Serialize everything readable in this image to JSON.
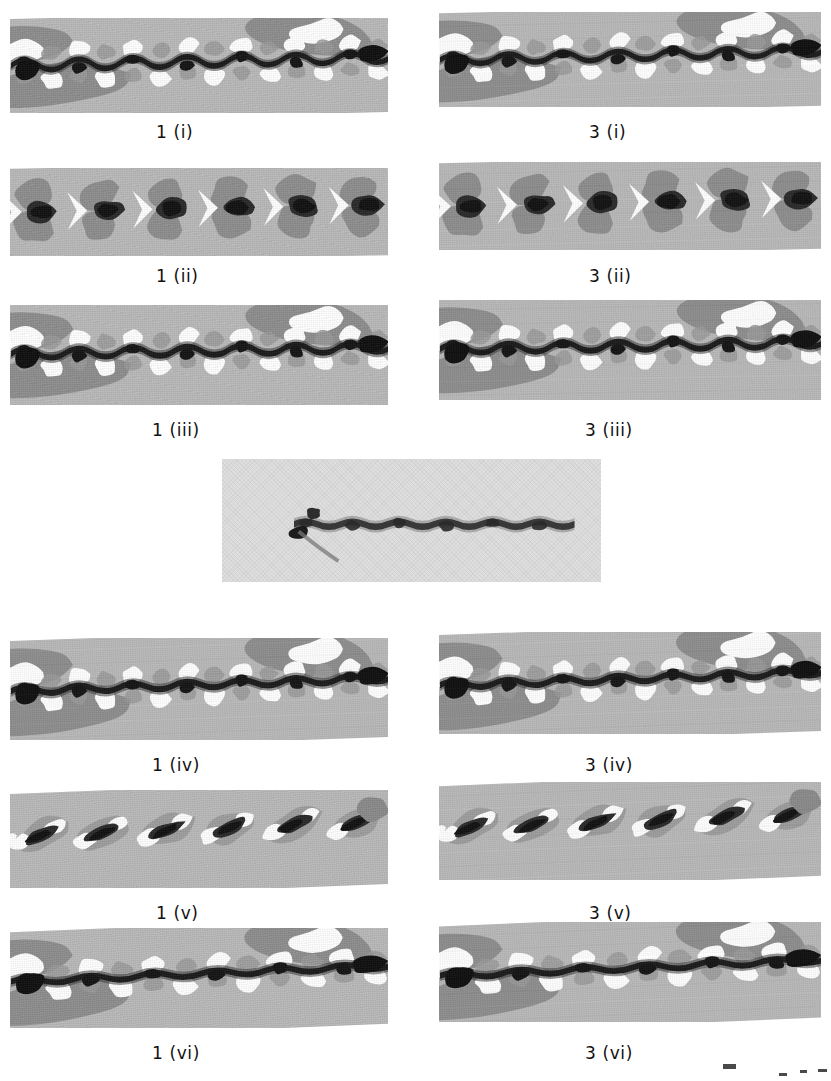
{
  "figure": {
    "width": 831,
    "height": 1081,
    "background_color": "#ffffff",
    "panel_count": 13,
    "columns": [
      "1",
      "3"
    ],
    "caption_color": "#111111",
    "plate_colors": {
      "mid_gray": "#b9b9b9",
      "dark_gray": "#8e8e8e",
      "black": "#1b1b1b",
      "white": "#ffffff",
      "photo_gray": "#dedede"
    }
  },
  "panels": [
    {
      "id": "p-1-i",
      "label": "1 (i)",
      "column": "1",
      "row": "i",
      "x": 10,
      "y": 18,
      "w": 378,
      "h": 95,
      "caption_x": 156,
      "caption_y": 122,
      "style": "wavy-filament",
      "lobes": 7,
      "amplitude": 9,
      "tilt": -1.3,
      "has_label": true
    },
    {
      "id": "p-3-i",
      "label": "3 (i)",
      "column": "3",
      "row": "i",
      "x": 439,
      "y": 12,
      "w": 382,
      "h": 95,
      "caption_x": 589,
      "caption_y": 122,
      "style": "wavy-filament",
      "lobes": 7,
      "amplitude": 8,
      "tilt": -1.4,
      "has_label": true
    },
    {
      "id": "p-1-ii",
      "label": "1 (ii)",
      "column": "1",
      "row": "ii",
      "x": 10,
      "y": 168,
      "w": 378,
      "h": 88,
      "caption_x": 156,
      "caption_y": 266,
      "style": "chevron-beads",
      "lobes": 6,
      "amplitude": 0,
      "tilt": -1.2,
      "has_label": true
    },
    {
      "id": "p-3-ii",
      "label": "3 (ii)",
      "column": "3",
      "row": "ii",
      "x": 439,
      "y": 162,
      "w": 382,
      "h": 88,
      "caption_x": 589,
      "caption_y": 266,
      "style": "chevron-beads",
      "lobes": 6,
      "amplitude": 0,
      "tilt": -1.3,
      "has_label": true
    },
    {
      "id": "p-1-iii",
      "label": "1 (iii)",
      "column": "1",
      "row": "iii",
      "x": 10,
      "y": 305,
      "w": 378,
      "h": 100,
      "caption_x": 152,
      "caption_y": 420,
      "style": "wavy-filament",
      "lobes": 7,
      "amplitude": 8,
      "tilt": -1.0,
      "has_label": true
    },
    {
      "id": "p-3-iii",
      "label": "3 (iii)",
      "column": "3",
      "row": "iii",
      "x": 439,
      "y": 300,
      "w": 382,
      "h": 100,
      "caption_x": 585,
      "caption_y": 420,
      "style": "wavy-filament",
      "lobes": 7,
      "amplitude": 8,
      "tilt": -1.0,
      "has_label": true
    },
    {
      "id": "p-center",
      "label": "",
      "column": "center",
      "row": "center",
      "x": 222,
      "y": 459,
      "w": 379,
      "h": 123,
      "caption_x": 0,
      "caption_y": 0,
      "style": "photograph",
      "lobes": 6,
      "amplitude": 5,
      "tilt": -0.6,
      "has_label": false
    },
    {
      "id": "p-1-iv",
      "label": "1 (iv)",
      "column": "1",
      "row": "iv",
      "x": 10,
      "y": 638,
      "w": 378,
      "h": 102,
      "caption_x": 152,
      "caption_y": 755,
      "style": "wavy-filament",
      "lobes": 7,
      "amplitude": 6,
      "tilt": -2.0,
      "has_label": true
    },
    {
      "id": "p-3-iv",
      "label": "3 (iv)",
      "column": "3",
      "row": "iv",
      "x": 439,
      "y": 632,
      "w": 382,
      "h": 102,
      "caption_x": 585,
      "caption_y": 755,
      "style": "wavy-filament",
      "lobes": 7,
      "amplitude": 6,
      "tilt": -2.0,
      "has_label": true
    },
    {
      "id": "p-1-v",
      "label": "1 (v)",
      "column": "1",
      "row": "v",
      "x": 10,
      "y": 790,
      "w": 378,
      "h": 98,
      "caption_x": 156,
      "caption_y": 903,
      "style": "slanted-stripes",
      "lobes": 6,
      "amplitude": 0,
      "tilt": -2.3,
      "has_label": true
    },
    {
      "id": "p-3-v",
      "label": "3 (v)",
      "column": "3",
      "row": "v",
      "x": 439,
      "y": 782,
      "w": 382,
      "h": 98,
      "caption_x": 589,
      "caption_y": 903,
      "style": "slanted-stripes",
      "lobes": 6,
      "amplitude": 0,
      "tilt": -2.3,
      "has_label": true
    },
    {
      "id": "p-1-vi",
      "label": "1 (vi)",
      "column": "1",
      "row": "vi",
      "x": 10,
      "y": 928,
      "w": 378,
      "h": 100,
      "caption_x": 152,
      "caption_y": 1043,
      "style": "wavy-filament",
      "lobes": 6,
      "amplitude": 5,
      "tilt": -2.4,
      "has_label": true
    },
    {
      "id": "p-3-vi",
      "label": "3 (vi)",
      "column": "3",
      "row": "vi",
      "x": 439,
      "y": 922,
      "w": 382,
      "h": 100,
      "caption_x": 585,
      "caption_y": 1043,
      "style": "wavy-filament",
      "lobes": 6,
      "amplitude": 5,
      "tilt": -2.4,
      "has_label": true
    }
  ],
  "stray_marks": [
    {
      "x": 723,
      "y": 1064,
      "w": 13,
      "h": 5
    },
    {
      "x": 779,
      "y": 1073,
      "w": 8,
      "h": 3
    },
    {
      "x": 800,
      "y": 1070,
      "w": 7,
      "h": 3
    },
    {
      "x": 818,
      "y": 1069,
      "w": 9,
      "h": 3
    }
  ]
}
